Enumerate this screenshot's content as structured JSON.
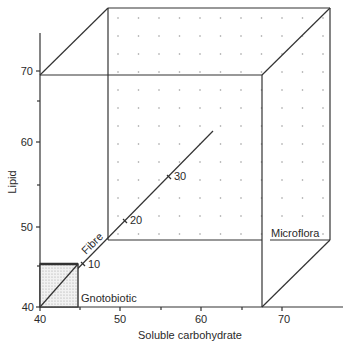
{
  "figure": {
    "x_axis": {
      "label": "Soluble carbohydrate",
      "ticks": [
        "40",
        "50",
        "60",
        "70"
      ]
    },
    "y_axis": {
      "label": "Lipid",
      "ticks": [
        "40",
        "50",
        "60",
        "70"
      ]
    },
    "z_axis": {
      "label": "Fibre",
      "ticks": [
        "10",
        "20",
        "30"
      ]
    },
    "regions": {
      "small_box": "Gnotobiotic",
      "large_box": "Microflora"
    }
  },
  "chart_data": {
    "type": "diagram-3d-box",
    "axes": {
      "x": {
        "label": "Soluble carbohydrate",
        "ticks": [
          40,
          50,
          60,
          70
        ]
      },
      "y": {
        "label": "Lipid",
        "ticks": [
          40,
          50,
          60,
          70
        ]
      },
      "z": {
        "label": "Fibre",
        "ticks": [
          10,
          20,
          30
        ]
      }
    },
    "boxes": [
      {
        "name": "Gnotobiotic",
        "x": [
          40,
          45
        ],
        "y": [
          40,
          45
        ],
        "z": [
          0,
          0
        ],
        "shaded": true
      },
      {
        "name": "Microflora",
        "x": [
          40,
          67
        ],
        "y": [
          40,
          68
        ],
        "z": [
          0,
          40
        ],
        "shaded": false
      }
    ]
  }
}
